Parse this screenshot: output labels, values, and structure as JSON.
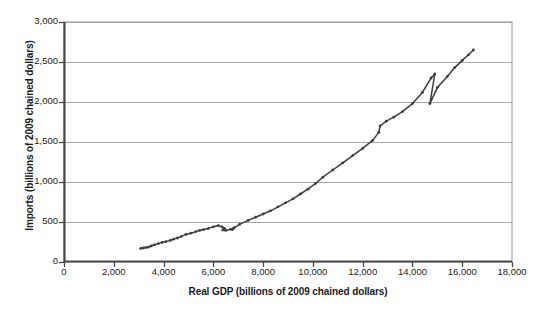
{
  "chart_data": {
    "type": "line",
    "title": "",
    "subtitle": "",
    "xlabel": "Real GDP (billions of 2009 chained dollars)",
    "ylabel": "Imports (billions of 2009 chained dollars)",
    "xlim": [
      0,
      18000
    ],
    "ylim": [
      0,
      3000
    ],
    "xticks": [
      "0",
      "2,000",
      "4,000",
      "6,000",
      "8,000",
      "10,000",
      "12,000",
      "14,000",
      "16,000",
      "18,000"
    ],
    "xtick_values": [
      0,
      2000,
      4000,
      6000,
      8000,
      10000,
      12000,
      14000,
      16000,
      18000
    ],
    "yticks": [
      "0",
      "500",
      "1,000",
      "1,500",
      "2,000",
      "2,500",
      "3,000"
    ],
    "ytick_values": [
      0,
      500,
      1000,
      1500,
      2000,
      2500,
      3000
    ],
    "grid": "horizontal",
    "legend": "none",
    "line_color": "#3d3d3d",
    "marker": "small-dot",
    "series": [
      {
        "name": "Imports vs Real GDP",
        "x": [
          3080,
          3180,
          3280,
          3380,
          3500,
          3640,
          3790,
          3940,
          4100,
          4270,
          4400,
          4560,
          4720,
          4900,
          5100,
          5300,
          5450,
          5600,
          5800,
          6000,
          6200,
          6350,
          6450,
          6380,
          6500,
          6700,
          6800,
          6760,
          6850,
          7050,
          7400,
          7700,
          8000,
          8300,
          8600,
          8900,
          9200,
          9500,
          9800,
          10100,
          10400,
          10800,
          11200,
          11600,
          12000,
          12400,
          12650,
          12700,
          12950,
          13250,
          13600,
          14000,
          14400,
          14750,
          14900,
          14700,
          15000,
          15400,
          15700,
          16000,
          16250,
          16450
        ],
        "y": [
          170,
          175,
          180,
          185,
          200,
          215,
          230,
          245,
          255,
          270,
          285,
          300,
          320,
          345,
          360,
          380,
          395,
          405,
          420,
          440,
          455,
          440,
          420,
          400,
          395,
          410,
          420,
          405,
          430,
          470,
          520,
          560,
          600,
          640,
          690,
          740,
          790,
          850,
          910,
          980,
          1060,
          1150,
          1240,
          1330,
          1420,
          1520,
          1620,
          1700,
          1760,
          1810,
          1880,
          1980,
          2120,
          2300,
          2350,
          1980,
          2180,
          2320,
          2430,
          2520,
          2590,
          2650
        ]
      }
    ]
  }
}
